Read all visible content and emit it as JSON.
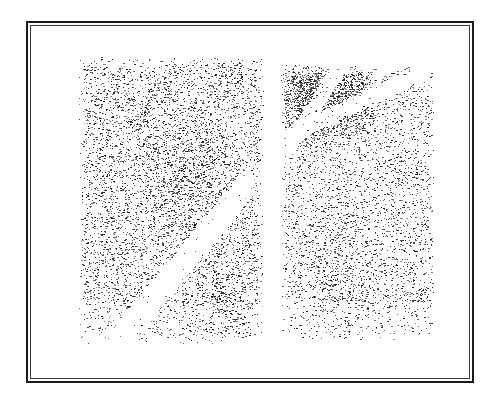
{
  "artwork": {
    "description": "Scanned stippled ink drawing, two panels side by side in a double-line frame",
    "colors": {
      "background": "#ffffff",
      "paper": "#fdfdfd",
      "ink": "#141414",
      "frame": "#1a1a1a"
    },
    "frame": {
      "outer": [
        26,
        21,
        448,
        362
      ],
      "inner": [
        30,
        25,
        440,
        354
      ]
    },
    "panels": [
      {
        "id": "left",
        "rect": [
          78,
          56,
          186,
          288
        ],
        "density": 0.22,
        "seed": 11,
        "dense_regions": [
          {
            "cx": 0.58,
            "cy": 0.42,
            "r": 0.28,
            "w": 0.22
          },
          {
            "cx": 0.75,
            "cy": 0.88,
            "r": 0.22,
            "w": 0.18
          },
          {
            "cx": 0.3,
            "cy": 0.2,
            "r": 0.22,
            "w": 0.08
          }
        ],
        "light_bands": [
          {
            "x1": 0.2,
            "y1": 1.0,
            "x2": 0.9,
            "y2": 0.45,
            "w": 0.05
          }
        ]
      },
      {
        "id": "right",
        "rect": [
          280,
          64,
          154,
          276
        ],
        "density": 0.18,
        "seed": 29,
        "dense_regions": [
          {
            "cx": 0.18,
            "cy": 0.1,
            "r": 0.26,
            "w": 0.75
          },
          {
            "cx": 0.45,
            "cy": 0.12,
            "r": 0.2,
            "w": 0.55
          },
          {
            "cx": 0.35,
            "cy": 0.8,
            "r": 0.3,
            "w": 0.16
          }
        ],
        "light_bands": [
          {
            "x1": 0.05,
            "y1": 0.3,
            "x2": 0.4,
            "y2": 0.0,
            "w": 0.035
          },
          {
            "x1": 0.05,
            "y1": 0.26,
            "x2": 0.95,
            "y2": 0.02,
            "w": 0.03
          }
        ]
      }
    ]
  }
}
